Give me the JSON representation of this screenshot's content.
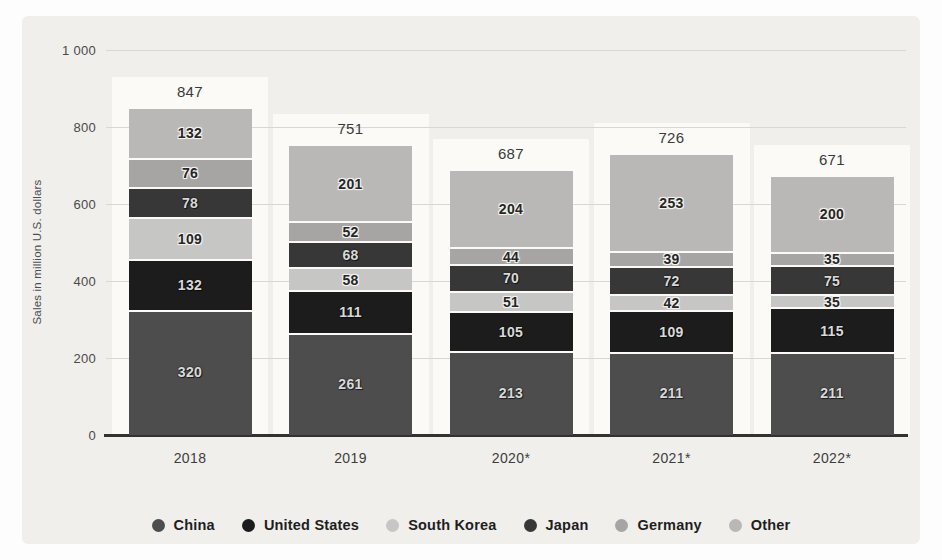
{
  "y_axis": {
    "title": "Sales in million U.S. dollars",
    "ticks": [
      "0",
      "200",
      "400",
      "600",
      "800",
      "1 000"
    ],
    "tick_values": [
      0,
      200,
      400,
      600,
      800,
      1000
    ]
  },
  "chart_data": {
    "type": "bar",
    "stacked": true,
    "title": "",
    "xlabel": "",
    "ylabel": "Sales in million U.S. dollars",
    "ylim": [
      0,
      1000
    ],
    "grid": true,
    "legend_position": "bottom",
    "categories": [
      "2018",
      "2019",
      "2020*",
      "2021*",
      "2022*"
    ],
    "totals": [
      847,
      751,
      687,
      726,
      671
    ],
    "series": [
      {
        "name": "China",
        "color": "#4d4d4d",
        "dark": true,
        "values": [
          320,
          261,
          213,
          211,
          211
        ]
      },
      {
        "name": "United States",
        "color": "#1c1c1c",
        "dark": true,
        "values": [
          132,
          111,
          105,
          109,
          115
        ]
      },
      {
        "name": "South Korea",
        "color": "#c6c6c5",
        "dark": false,
        "values": [
          109,
          58,
          51,
          42,
          35
        ]
      },
      {
        "name": "Japan",
        "color": "#373737",
        "dark": true,
        "values": [
          78,
          68,
          70,
          72,
          75
        ]
      },
      {
        "name": "Germany",
        "color": "#a6a5a3",
        "dark": false,
        "values": [
          76,
          52,
          44,
          39,
          35
        ]
      },
      {
        "name": "Other",
        "color": "#b9b8b6",
        "dark": false,
        "values": [
          132,
          201,
          204,
          253,
          200
        ]
      }
    ]
  },
  "colors": {
    "panel_background": "#f0efec",
    "column_highlight": "#fbfaf7",
    "gridline": "#d8d7d3",
    "axis_line": "#333231",
    "tick_text": "#4a4a4a",
    "label_text": "#3a3a3a"
  }
}
